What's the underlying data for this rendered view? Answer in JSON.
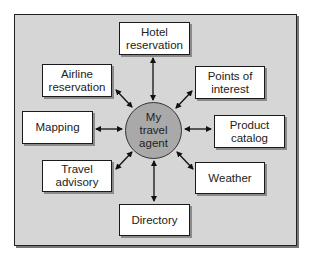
{
  "diagram": {
    "type": "hub-and-spoke",
    "colors": {
      "frame_background": "#d6d6d6",
      "hub_fill": "#a9a9a9",
      "node_fill": "#ffffff",
      "line": "#111111"
    },
    "hub": {
      "label": "My\ntravel\nagent"
    },
    "nodes": [
      {
        "id": "hotel",
        "label": "Hotel\nreservation"
      },
      {
        "id": "points",
        "label": "Points of\ninterest"
      },
      {
        "id": "product",
        "label": "Product\ncatalog"
      },
      {
        "id": "weather",
        "label": "Weather"
      },
      {
        "id": "directory",
        "label": "Directory"
      },
      {
        "id": "travel",
        "label": "Travel\nadvisory"
      },
      {
        "id": "mapping",
        "label": "Mapping"
      },
      {
        "id": "airline",
        "label": "Airline\nreservation"
      }
    ],
    "edges": [
      {
        "from": "hub",
        "to": "hotel",
        "direction": "bidirectional"
      },
      {
        "from": "hub",
        "to": "points",
        "direction": "bidirectional"
      },
      {
        "from": "hub",
        "to": "product",
        "direction": "bidirectional"
      },
      {
        "from": "hub",
        "to": "weather",
        "direction": "bidirectional"
      },
      {
        "from": "hub",
        "to": "directory",
        "direction": "bidirectional"
      },
      {
        "from": "hub",
        "to": "travel",
        "direction": "bidirectional"
      },
      {
        "from": "hub",
        "to": "mapping",
        "direction": "bidirectional"
      },
      {
        "from": "hub",
        "to": "airline",
        "direction": "bidirectional"
      }
    ]
  }
}
